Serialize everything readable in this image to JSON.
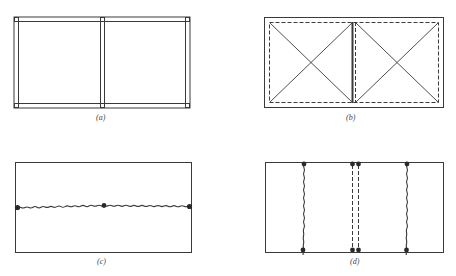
{
  "figure": {
    "colors": {
      "ink": "#3a3a3a",
      "background": "#ffffff"
    },
    "panels": [
      {
        "id": "a",
        "label": "(a)",
        "description": "Two-bay frame drawn with double lines (beams and columns), small squares at joints"
      },
      {
        "id": "b",
        "label": "(b)",
        "description": "Two-bay panel with dashed inner outline, crossed diagonals in each bay, thick central divider"
      },
      {
        "id": "c",
        "label": "(c)",
        "description": "Rectangle with one wavy horizontal yield line across mid-height, dots at left, center, right supports"
      },
      {
        "id": "d",
        "label": "(d)",
        "description": "Rectangle with two wavy vertical yield lines and a pair of dashed vertical lines at center, dots at ends"
      }
    ]
  }
}
